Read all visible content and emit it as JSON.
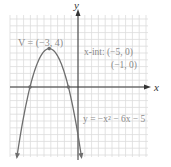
{
  "chart_data": {
    "type": "line",
    "title": "",
    "equation": "y = −x² − 6x − 5",
    "function": {
      "a": -1,
      "b": -6,
      "c": -5
    },
    "xlabel": "x",
    "ylabel": "y",
    "xlim": [
      -7.1,
      7.3
    ],
    "ylim": [
      -7.3,
      7.5
    ],
    "grid": true,
    "annotations": {
      "vertex": "V = (−3, 4)",
      "xint_line1": "x-int: (−5, 0)",
      "xint_line2": "(−1, 0)",
      "equation_label": "y = −x² − 6x − 5"
    },
    "points": [
      {
        "name": "vertex",
        "x": -3,
        "y": 4
      },
      {
        "name": "x-intercept",
        "x": -5,
        "y": 0
      },
      {
        "name": "x-intercept",
        "x": -1,
        "y": 0
      }
    ],
    "colors": {
      "curve": "#6e6e6e",
      "grid": "#dcdcdc",
      "axis": "#333333",
      "label": "#8a8a8a"
    }
  }
}
